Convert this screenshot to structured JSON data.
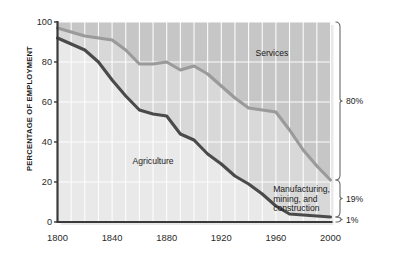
{
  "chart_data": {
    "type": "area",
    "title": "",
    "xlabel": "",
    "ylabel": "PERCENTAGE OF EMPLOYMENT",
    "xlim": [
      1800,
      2000
    ],
    "ylim": [
      0,
      100
    ],
    "grid": true,
    "legend_position": "inline-annotations",
    "x_ticks": [
      "1800",
      "1840",
      "1880",
      "1920",
      "1960",
      "2000"
    ],
    "x_tick_values": [
      1800,
      1840,
      1880,
      1920,
      1960,
      2000
    ],
    "y_ticks": [
      "0",
      "20",
      "40",
      "60",
      "80",
      "100"
    ],
    "y_tick_values": [
      0,
      20,
      40,
      60,
      80,
      100
    ],
    "x": [
      1800,
      1810,
      1820,
      1830,
      1840,
      1850,
      1860,
      1870,
      1880,
      1890,
      1900,
      1910,
      1920,
      1930,
      1940,
      1950,
      1960,
      1970,
      1980,
      1990,
      2000
    ],
    "series": [
      {
        "name": "Agriculture",
        "color": "#4a4a4a",
        "boundary_values": [
          92,
          89,
          86,
          80,
          71,
          63,
          56,
          54,
          53,
          44,
          41,
          34,
          29,
          23,
          19,
          14,
          8,
          4,
          3.5,
          3,
          2.5
        ]
      },
      {
        "name": "Manufacturing, mining, and construction",
        "color": "#8a8a8a",
        "boundary_values": [
          97,
          95,
          93,
          92,
          91,
          86,
          79,
          79,
          80,
          76,
          78,
          74,
          68,
          62,
          57,
          56,
          55,
          46,
          36,
          28,
          21
        ]
      },
      {
        "name": "Services",
        "color": "#b9b9b9",
        "boundary_values": [
          100,
          100,
          100,
          100,
          100,
          100,
          100,
          100,
          100,
          100,
          100,
          100,
          100,
          100,
          100,
          100,
          100,
          100,
          100,
          100,
          100
        ]
      }
    ],
    "annotations": [
      {
        "text": "Services",
        "x": 1945,
        "y": 84
      },
      {
        "text": "Agriculture",
        "x": 1855,
        "y": 30
      },
      {
        "text": "Manufacturing,\nmining, and\nconstruction",
        "x": 1958,
        "y": 16
      }
    ],
    "right_braces": [
      {
        "label": "80%",
        "from": 21,
        "to": 100,
        "value": 80
      },
      {
        "label": "19%",
        "from": 2.5,
        "to": 21,
        "value": 19
      },
      {
        "label": "1%",
        "from": 0,
        "to": 2.5,
        "value": 1
      }
    ],
    "colors": {
      "background": "#ffffff",
      "plot_upper_band": "#c6c6c6",
      "plot_mid_band": "#d8d8d8",
      "plot_lower_band": "#e9e9e9",
      "gridline": "#ffffff",
      "axis": "#3a3a3a",
      "agriculture_line": "#4a4a4a",
      "services_line": "#9a9a9a",
      "text": "#1b1b1b"
    }
  }
}
